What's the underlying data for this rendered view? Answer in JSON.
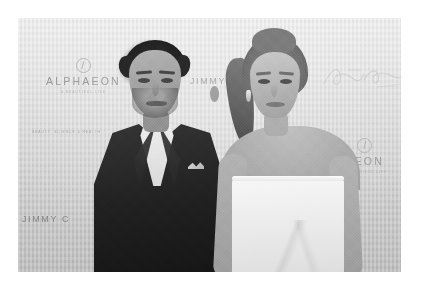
{
  "page": {
    "background_color": "#ffffff",
    "photo": {
      "treatment": "black-and-white",
      "left": 18,
      "top": 18,
      "width": 383,
      "height": 254
    }
  },
  "backdrop": {
    "description": "step-and-repeat event backdrop",
    "base_color": "#d6d5d3",
    "logos": [
      {
        "name": "alphaeon-logo-left",
        "mark": "circle-emblem-icon",
        "wordmark": "ALPHAEON",
        "tagline": "A BEAUTIFUL LIFE"
      },
      {
        "name": "alphaeon-logo-right",
        "mark": "circle-emblem-icon",
        "wordmark": "AEON",
        "tagline": "A BEAUTIFUL LIFE"
      }
    ],
    "text_marks": [
      {
        "name": "jimmy-choo-top",
        "text": "JIMMY"
      },
      {
        "name": "jimmy-choo-bottom",
        "text": "JIMMY C"
      },
      {
        "name": "partial-mark-bottom-right",
        "text": "CK"
      }
    ],
    "signature_logo": {
      "name": "cursive-signature-logo",
      "style": "faint handwritten script"
    },
    "sponsor_credit": "BEAUTY, SCIENCE & HEALTH"
  },
  "subjects": {
    "man": {
      "name": "man-in-dark-suit",
      "hair_color": "#1b1917",
      "attire": "dark navy suit, white dress shirt, white pocket square",
      "pose": "standing, facing camera"
    },
    "woman": {
      "name": "woman-in-white-dress",
      "hair_color": "#7c674e",
      "hairstyle": "high ponytail",
      "attire": "white strapless dress",
      "pose": "standing, head turned slightly left"
    }
  }
}
